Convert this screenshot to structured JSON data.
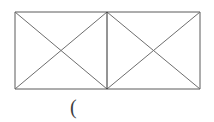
{
  "figure": {
    "title": "rectangle-divided-into-two-squares-with-diagonals",
    "background_color": "#ffffff",
    "stroke_color_outline": "#5a5a5a",
    "stroke_color_diagonal": "#6e6e6e",
    "stroke_color_divider": "#2b2b2b",
    "stroke_width": 1,
    "bounds": {
      "left": 15,
      "top": 12,
      "right": 200,
      "bottom": 89,
      "width": 185,
      "height": 77
    },
    "divider_x": 107,
    "vertices": {
      "top_left": "15,12",
      "top_mid": "107,12",
      "top_right": "200,12",
      "bottom_left": "15,89",
      "bottom_mid": "107,89",
      "bottom_right": "200,89"
    },
    "left_cell_center": "61,50",
    "right_cell_center": "153,50",
    "segments": [
      {
        "name": "outline-top",
        "from": "15,12",
        "to": "200,12"
      },
      {
        "name": "outline-bottom",
        "from": "15,89",
        "to": "200,89"
      },
      {
        "name": "outline-left",
        "from": "15,12",
        "to": "15,89"
      },
      {
        "name": "outline-right",
        "from": "200,12",
        "to": "200,89"
      },
      {
        "name": "divider-vertical",
        "from": "107,12",
        "to": "107,89"
      },
      {
        "name": "left-diagonal-down",
        "from": "15,12",
        "to": "107,89"
      },
      {
        "name": "left-diagonal-up",
        "from": "15,89",
        "to": "107,12"
      },
      {
        "name": "right-diagonal-down",
        "from": "107,12",
        "to": "200,89"
      },
      {
        "name": "right-diagonal-up",
        "from": "107,89",
        "to": "200,12"
      }
    ]
  },
  "caption": {
    "text": "(",
    "x": 70,
    "y": 96,
    "font_size": "20px",
    "color": "#3d3d3d"
  }
}
